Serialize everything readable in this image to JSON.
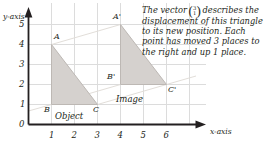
{
  "figure": {
    "name": "translation-vector-diagram",
    "axes": {
      "x_axis_title": "x-axis",
      "y_axis_title": "y-axis",
      "x_ticks": [
        "0",
        "1",
        "2",
        "3",
        "4",
        "5",
        "6"
      ],
      "y_ticks": [
        "0",
        "1",
        "2",
        "3",
        "4",
        "5"
      ],
      "x_range": [
        0,
        6.6
      ],
      "y_range": [
        0,
        5.5
      ],
      "grid": true
    },
    "note": {
      "part1": "The vector",
      "vector_top": "3",
      "vector_bottom": "1",
      "part2": "describes the displacement of this triangle to its new position. Each point has moved 3 places to the right and up 1 place."
    },
    "shapes": [
      {
        "role": "object",
        "label": "Object",
        "vertices": [
          {
            "label": "A",
            "x": 1,
            "y": 4
          },
          {
            "label": "B",
            "x": 1,
            "y": 1
          },
          {
            "label": "C",
            "x": 3,
            "y": 1
          }
        ]
      },
      {
        "role": "image",
        "label": "Image",
        "vertices": [
          {
            "label": "A'",
            "x": 4,
            "y": 5
          },
          {
            "label": "B'",
            "x": 4,
            "y": 2
          },
          {
            "label": "C'",
            "x": 6,
            "y": 2
          }
        ]
      }
    ],
    "translation": {
      "dx": 3,
      "dy": 1
    },
    "colors": {
      "shape_fill": "#d5d1ce",
      "shape_stroke": "#b9b4b0",
      "grid_line": "#dcdcdc",
      "axis": "#231f20",
      "connector": "#e2ded9",
      "text": "#231f20"
    }
  }
}
